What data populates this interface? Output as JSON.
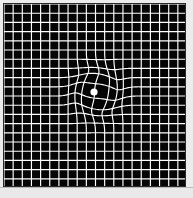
{
  "figure": {
    "title": "Amsler grid with central metamorphopsia (wavy distortion)",
    "type": "amsler-grid-eye-test-chart"
  },
  "chart_data": {
    "type": "heatmap",
    "title": "Amsler Grid",
    "xlabel": "",
    "ylabel": "",
    "grid": true,
    "legend": false,
    "background_color": "#050505",
    "line_color": "#ffffff",
    "fixation_dot_color": "#ffffff",
    "columns": 20,
    "rows": 20,
    "cell_size_px": 9.1,
    "grid_origin_px": [
      4,
      4
    ],
    "grid_extent_px": [
      182,
      186
    ],
    "fixation_dot": {
      "x": 94,
      "y": 92,
      "radius": 3.6,
      "label": "central fixation dot"
    },
    "distortion": {
      "model": "radial-sinusoidal-warp",
      "center_x": 97,
      "center_y": 92,
      "radius_px": 42,
      "amplitude_px": 5.2,
      "wave_count": 1.6,
      "description": "central region of grid lines is bowed and wavy, simulating metamorphopsia seen in macular degeneration"
    },
    "xlim": [
      0,
      183
    ],
    "ylim": [
      0,
      184
    ]
  },
  "colors": {
    "background": "#ececec",
    "chart_background": "#050505",
    "grid_line": "#ffffff",
    "frame_border": "#2a2a2a",
    "bottom_strip": "#e9e9e9",
    "bottom_strip_border": "#b9b9b9"
  }
}
